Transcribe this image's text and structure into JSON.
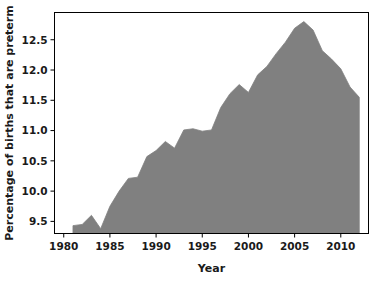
{
  "chart_data": {
    "type": "area",
    "title": "",
    "xlabel": "Year",
    "ylabel": "Percentage of births that are preterm",
    "xlim": [
      1979.0,
      1913.0
    ],
    "x_axis_range": [
      1979.0,
      2013.0
    ],
    "ylim": [
      9.3,
      12.95
    ],
    "grid": false,
    "legend": null,
    "fill_color": "#808080",
    "line_color": "#808080",
    "background_color": "#ffffff",
    "frame_color": "#000000",
    "xticks": [
      1980,
      1985,
      1990,
      1995,
      2000,
      2005,
      2010
    ],
    "xtick_labels": [
      "1980",
      "1985",
      "1990",
      "1995",
      "2000",
      "2005",
      "2010"
    ],
    "yticks": [
      9.5,
      10.0,
      10.5,
      11.0,
      11.5,
      12.0,
      12.5
    ],
    "ytick_labels": [
      "9.5",
      "10.0",
      "10.5",
      "11.0",
      "11.5",
      "12.0",
      "12.5"
    ],
    "x": [
      1981,
      1982,
      1983,
      1984,
      1985,
      1986,
      1987,
      1988,
      1989,
      1990,
      1991,
      1992,
      1993,
      1994,
      1995,
      1996,
      1997,
      1998,
      1999,
      2000,
      2001,
      2002,
      2003,
      2004,
      2005,
      2006,
      2007,
      2008,
      2009,
      2010,
      2011,
      2012
    ],
    "values": [
      9.43,
      9.45,
      9.6,
      9.38,
      9.75,
      10.0,
      10.21,
      10.23,
      10.57,
      10.67,
      10.82,
      10.71,
      11.01,
      11.03,
      10.99,
      11.01,
      11.38,
      11.61,
      11.76,
      11.63,
      11.92,
      12.06,
      12.27,
      12.46,
      12.69,
      12.8,
      12.66,
      12.32,
      12.18,
      12.02,
      11.72,
      11.55
    ]
  },
  "figure": {
    "xlabel_text": "Year",
    "ylabel_text": "Percentage of births that are preterm"
  }
}
